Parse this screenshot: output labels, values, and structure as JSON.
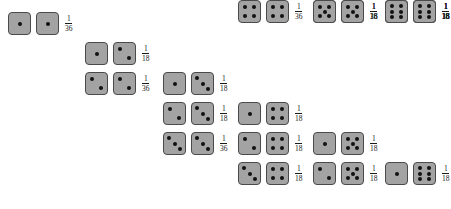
{
  "figure": {
    "die_face_color": "#a3a3a3",
    "die_border_color": "#4a4a4a",
    "pip_color": "#111111",
    "background_color": "#ffffff"
  },
  "layout": {
    "column_x": [
      8,
      85,
      163,
      238,
      313,
      385
    ],
    "row_y": [
      12,
      42,
      72,
      102,
      132,
      162
    ],
    "die_size": 23,
    "row_pitch": 30
  },
  "pip_positions": {
    "1": [
      [
        50,
        50
      ]
    ],
    "2": [
      [
        28,
        28
      ],
      [
        72,
        72
      ]
    ],
    "3": [
      [
        26,
        26
      ],
      [
        50,
        50
      ],
      [
        74,
        74
      ]
    ],
    "4": [
      [
        28,
        28
      ],
      [
        72,
        28
      ],
      [
        28,
        72
      ],
      [
        72,
        72
      ]
    ],
    "5": [
      [
        28,
        28
      ],
      [
        72,
        28
      ],
      [
        50,
        50
      ],
      [
        28,
        72
      ],
      [
        72,
        72
      ]
    ],
    "6": [
      [
        30,
        24
      ],
      [
        70,
        24
      ],
      [
        30,
        50
      ],
      [
        70,
        50
      ],
      [
        30,
        76
      ],
      [
        70,
        76
      ]
    ]
  },
  "columns": [
    {
      "name": "column-1",
      "first_die": 1,
      "rows": [
        {
          "dice": [
            1,
            1
          ],
          "numerator": "1",
          "denominator": "36",
          "probability": "1/36"
        }
      ]
    },
    {
      "name": "column-2",
      "first_die": 2,
      "rows": [
        {
          "dice": [
            1,
            2
          ],
          "numerator": "1",
          "denominator": "18",
          "probability": "1/18"
        },
        {
          "dice": [
            2,
            2
          ],
          "numerator": "1",
          "denominator": "36",
          "probability": "1/36"
        }
      ]
    },
    {
      "name": "column-3",
      "first_die": 3,
      "rows": [
        {
          "dice": [
            1,
            3
          ],
          "numerator": "1",
          "denominator": "18",
          "probability": "1/18"
        },
        {
          "dice": [
            2,
            3
          ],
          "numerator": "1",
          "denominator": "18",
          "probability": "1/18"
        },
        {
          "dice": [
            3,
            3
          ],
          "numerator": "1",
          "denominator": "36",
          "probability": "1/36"
        }
      ]
    },
    {
      "name": "column-4",
      "first_die": 4,
      "rows": [
        {
          "dice": [
            1,
            4
          ],
          "numerator": "1",
          "denominator": "18",
          "probability": "1/18"
        },
        {
          "dice": [
            2,
            4
          ],
          "numerator": "1",
          "denominator": "18",
          "probability": "1/18"
        },
        {
          "dice": [
            3,
            4
          ],
          "numerator": "1",
          "denominator": "18",
          "probability": "1/18"
        },
        {
          "dice": [
            4,
            4
          ],
          "numerator": "1",
          "denominator": "36",
          "probability": "1/36"
        }
      ]
    },
    {
      "name": "column-5",
      "first_die": 5,
      "rows": [
        {
          "dice": [
            1,
            5
          ],
          "numerator": "1",
          "denominator": "18",
          "probability": "1/18"
        },
        {
          "dice": [
            2,
            5
          ],
          "numerator": "1",
          "denominator": "18",
          "probability": "1/18"
        },
        {
          "dice": [
            3,
            5
          ],
          "numerator": "1",
          "denominator": "18",
          "probability": "1/18"
        },
        {
          "dice": [
            4,
            5
          ],
          "numerator": "1",
          "denominator": "18",
          "probability": "1/18"
        },
        {
          "dice": [
            5,
            5
          ],
          "numerator": "1",
          "denominator": "36",
          "probability": "1/36"
        }
      ]
    },
    {
      "name": "column-6",
      "first_die": 6,
      "rows": [
        {
          "dice": [
            1,
            6
          ],
          "numerator": "1",
          "denominator": "18",
          "probability": "1/18"
        },
        {
          "dice": [
            2,
            6
          ],
          "numerator": "1",
          "denominator": "18",
          "probability": "1/18"
        },
        {
          "dice": [
            3,
            6
          ],
          "numerator": "1",
          "denominator": "18",
          "probability": "1/18"
        },
        {
          "dice": [
            4,
            6
          ],
          "numerator": "1",
          "denominator": "18",
          "probability": "1/18"
        },
        {
          "dice": [
            5,
            6
          ],
          "numerator": "1",
          "denominator": "18",
          "probability": "1/18"
        },
        {
          "dice": [
            6,
            6
          ],
          "numerator": "1",
          "denominator": "36",
          "probability": "1/36"
        }
      ]
    }
  ]
}
